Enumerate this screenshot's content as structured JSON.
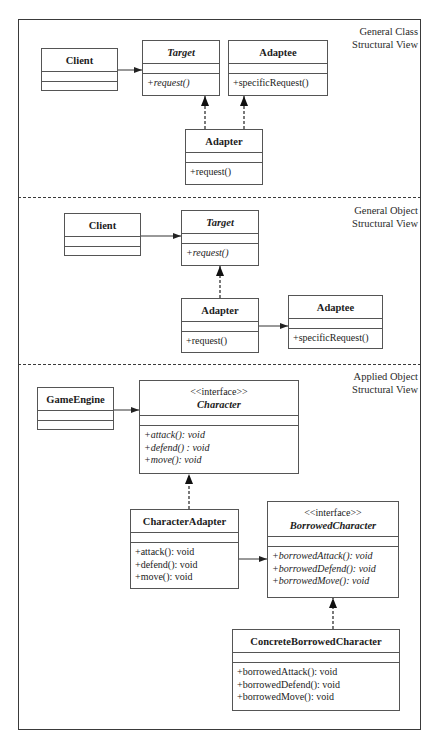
{
  "sections": [
    {
      "label_line1": "General Class",
      "label_line2": "Structural View",
      "classes": {
        "client": {
          "name": "Client",
          "ops": []
        },
        "target": {
          "name": "Target",
          "abstract": true,
          "ops": [
            "+request()"
          ]
        },
        "adaptee": {
          "name": "Adaptee",
          "ops": [
            "+specificRequest()"
          ]
        },
        "adapter": {
          "name": "Adapter",
          "ops": [
            "+request()"
          ]
        }
      }
    },
    {
      "label_line1": "General Object",
      "label_line2": "Structural View",
      "classes": {
        "client": {
          "name": "Client",
          "ops": []
        },
        "target": {
          "name": "Target",
          "abstract": true,
          "ops": [
            "+request()"
          ]
        },
        "adapter": {
          "name": "Adapter",
          "ops": [
            "+request()"
          ]
        },
        "adaptee": {
          "name": "Adaptee",
          "ops": [
            "+specificRequest()"
          ]
        }
      }
    },
    {
      "label_line1": "Applied Object",
      "label_line2": "Structural View",
      "classes": {
        "game_engine": {
          "name": "GameEngine",
          "ops": []
        },
        "character": {
          "stereotype": "<<interface>>",
          "name": "Character",
          "abstract": true,
          "ops": [
            "+attack(): void",
            "+defend() : void",
            "+move(): void"
          ]
        },
        "character_adapter": {
          "name": "CharacterAdapter",
          "ops": [
            "+attack(): void",
            "+defend(): void",
            "+move(): void"
          ]
        },
        "borrowed_character": {
          "stereotype": "<<interface>>",
          "name": "BorrowedCharacter",
          "abstract": true,
          "ops": [
            "+borrowedAttack(): void",
            "+borrowedDefend(): void",
            "+borrowedMove(): void"
          ]
        },
        "concrete_borrowed_character": {
          "name": "ConcreteBorrowedCharacter",
          "ops": [
            "+borrowedAttack(): void",
            "+borrowedDefend(): void",
            "+borrowedMove(): void"
          ]
        }
      }
    }
  ]
}
